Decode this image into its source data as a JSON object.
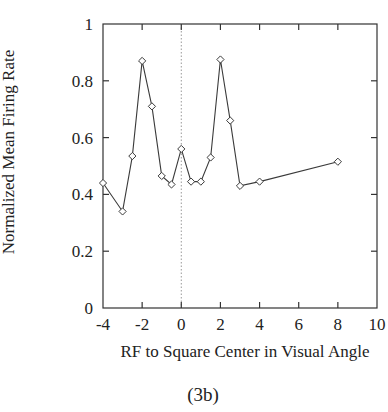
{
  "chart_data": {
    "type": "line",
    "title": "",
    "caption": "(3b)",
    "xlabel": "RF to Square Center in Visual Angle",
    "ylabel": "Normalized Mean Firing Rate",
    "xlim": [
      -4,
      10
    ],
    "ylim": [
      0,
      1
    ],
    "xticks": [
      -4,
      -2,
      0,
      2,
      4,
      6,
      8,
      10
    ],
    "xtick_labels": [
      "-4",
      "-2",
      "0",
      "2",
      "4",
      "6",
      "8",
      "10"
    ],
    "yticks": [
      0,
      0.2,
      0.4,
      0.6,
      0.8,
      1
    ],
    "ytick_labels": [
      "0",
      "0.2",
      "0.4",
      "0.6",
      "0.8",
      "1"
    ],
    "grid": false,
    "reference_line": {
      "x": 0,
      "style": "dotted"
    },
    "marker": "diamond",
    "series": [
      {
        "name": "firing-rate",
        "x": [
          -4,
          -3,
          -2.5,
          -2,
          -1.5,
          -1,
          -0.5,
          0,
          0.5,
          1,
          1.5,
          2,
          2.5,
          3,
          4,
          8
        ],
        "y": [
          0.44,
          0.34,
          0.535,
          0.87,
          0.71,
          0.465,
          0.435,
          0.56,
          0.445,
          0.445,
          0.53,
          0.875,
          0.66,
          0.43,
          0.445,
          0.515
        ]
      }
    ],
    "colors": {
      "line": "#3a3a3a",
      "axis": "#333333",
      "reference": "#999999"
    }
  }
}
